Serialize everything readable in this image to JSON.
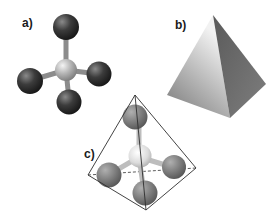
{
  "figure": {
    "panels": [
      {
        "id": "a",
        "label": "a)",
        "description": "Ball-and-stick model: central atom with four bonded atoms in tetrahedral arrangement"
      },
      {
        "id": "b",
        "label": "b)",
        "description": "Solid shaded tetrahedron (triangular pyramid)"
      },
      {
        "id": "c",
        "label": "c)",
        "description": "Ball-and-stick model inscribed in a wireframe tetrahedron, hidden edge dashed"
      }
    ]
  },
  "colors": {
    "outer_atom_dark": "#3a3a3a",
    "outer_atom_mid": "#8a8a8a",
    "central_atom": "#b8b8b8",
    "bond": "#8c8c8c",
    "pyramid_light_face": "#d9d9d9",
    "pyramid_dark_face": "#6e6e6e",
    "wireframe": "#333333"
  }
}
